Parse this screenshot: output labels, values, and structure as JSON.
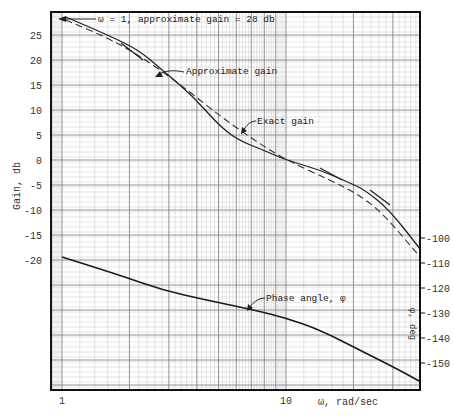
{
  "chart_data": {
    "type": "line",
    "title": "",
    "xlabel": "ω, rad/sec",
    "ylabel": "Gain, db",
    "ylabel_right": "φ, deg",
    "xscale": "log",
    "xlim": [
      1,
      40
    ],
    "x_ticks": [
      {
        "value": 1,
        "label": "1"
      },
      {
        "value": 10,
        "label": "10"
      }
    ],
    "ylim": [
      -23,
      30
    ],
    "y_ticks": [
      "25",
      "20",
      "15",
      "10",
      "5",
      "0",
      "-5",
      "-10",
      "-15",
      "-20"
    ],
    "y_tick_values": [
      25,
      20,
      15,
      10,
      5,
      0,
      -5,
      -10,
      -15,
      -20
    ],
    "ylim_right": [
      -160,
      -90
    ],
    "y_ticks_right": [
      "-100",
      "-110",
      "-120",
      "-130",
      "-140",
      "-150"
    ],
    "y_tick_values_right": [
      -100,
      -110,
      -120,
      -130,
      -140,
      -150
    ],
    "grid": true,
    "legend": "none (inline annotations)",
    "series": [
      {
        "name": "Exact gain",
        "axis": "left",
        "style": "solid",
        "x": [
          1.04,
          1.6,
          2.2,
          2.8,
          3.8,
          5.0,
          6.1,
          7.9,
          10.0,
          14.2,
          19.3,
          22.5,
          29.0,
          40.0
        ],
        "values": [
          28.6,
          25.0,
          22.0,
          18.0,
          13.0,
          7.0,
          4.0,
          2.0,
          0.0,
          -2.0,
          -4.6,
          -6.0,
          -10.0,
          -18.0
        ]
      },
      {
        "name": "Approximate gain",
        "axis": "left",
        "style": "dashed",
        "x": [
          1.04,
          1.6,
          2.2,
          3.4,
          5.0,
          7.2,
          10.0,
          15.7,
          21.3,
          27.5,
          40.0
        ],
        "values": [
          28.0,
          24.4,
          21.0,
          15.0,
          9.0,
          4.0,
          0.0,
          -4.0,
          -7.0,
          -11.0,
          -19.6
        ]
      },
      {
        "name": "Phase angle, φ",
        "axis": "right",
        "style": "solid",
        "x": [
          1.0,
          1.8,
          2.8,
          4.4,
          7.2,
          10.0,
          14.2,
          21.3,
          32.0,
          40.0
        ],
        "values": [
          -107.6,
          -114.8,
          -120.8,
          -124.8,
          -128.8,
          -132.0,
          -136.8,
          -144.8,
          -152.8,
          -157.6
        ]
      }
    ],
    "annotations": [
      {
        "text": "ω = 1, approximate gain = 28 db",
        "points_to": "gain curve at ω = 1"
      },
      {
        "text": "Approximate gain",
        "points_to": "dashed curve"
      },
      {
        "text": "Exact gain",
        "points_to": "solid curve"
      },
      {
        "text": "Phase angle, φ",
        "points_to": "phase curve"
      }
    ]
  },
  "labels": {
    "ann_w1": "ω = 1, approximate gain = 28 db",
    "ann_approx": "Approximate gain",
    "ann_exact": "Exact gain",
    "ann_phase": "Phase angle, φ",
    "xlabel": "ω, rad/sec",
    "ylabel": "Gain, db",
    "ylabel_right": "φ, deg"
  },
  "layout": {
    "plot": {
      "left": 51,
      "right": 420,
      "top": 12,
      "bottom": 390
    },
    "x_px_at_1": 62,
    "px_per_decade": 224,
    "gain_px_at_0": 160,
    "gain_px_per_db": 5,
    "phase_px_at_m100": 238,
    "phase_px_per_deg": 2.5
  }
}
